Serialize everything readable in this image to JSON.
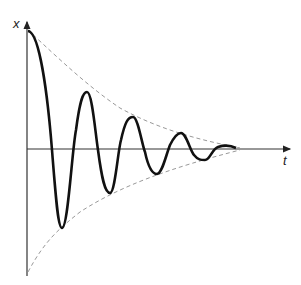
{
  "diagram": {
    "axes": {
      "y_label": "x",
      "x_label": "t"
    },
    "curves": [
      {
        "name": "oscillation",
        "style": "solid",
        "color": "#111111"
      },
      {
        "name": "upper-envelope",
        "style": "dashed",
        "color": "#999999"
      },
      {
        "name": "lower-envelope",
        "style": "dashed",
        "color": "#999999"
      }
    ]
  }
}
